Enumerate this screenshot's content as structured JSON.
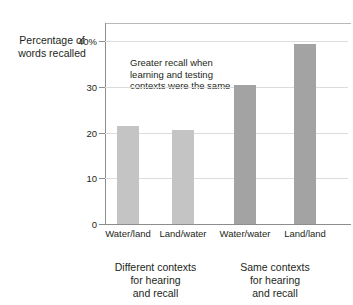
{
  "chart_data": {
    "type": "bar",
    "title": "",
    "xlabel": "",
    "ylabel": "Percentage of\nwords recalled",
    "categories": [
      "Water/land",
      "Land/water",
      "Water/water",
      "Land/land"
    ],
    "values": [
      21.5,
      20.5,
      30.4,
      39.3
    ],
    "ylim": [
      0,
      44
    ],
    "yticks": [
      0,
      10,
      20,
      30,
      40
    ],
    "ytick_labels": [
      "0",
      "10",
      "20",
      "30",
      "40%"
    ],
    "grid": true,
    "legend": "none",
    "bar_colors": [
      "#c4c4c4",
      "#c4c4c4",
      "#a3a3a3",
      "#a3a3a3"
    ],
    "annotations": [
      {
        "text": "Greater recall when\nlearning and testing\ncontexts were the same"
      }
    ],
    "groups": [
      {
        "label": "Different contexts\nfor hearing\nand recall",
        "categories": [
          "Water/land",
          "Land/water"
        ]
      },
      {
        "label": "Same contexts\nfor hearing\nand recall",
        "categories": [
          "Water/water",
          "Land/land"
        ]
      }
    ]
  },
  "colors": {
    "axis": "#8d8d8d",
    "grid": "#dcdcdc",
    "text": "#231f20",
    "background": "#ffffff"
  }
}
